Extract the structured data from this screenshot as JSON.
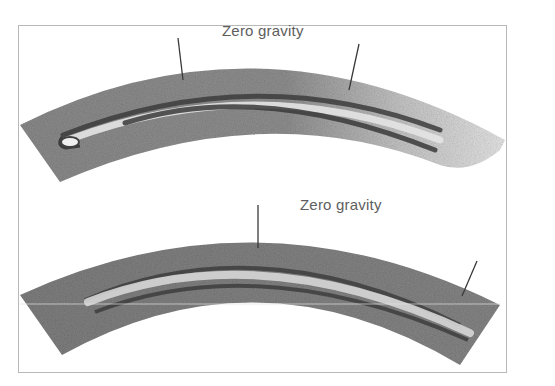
{
  "figure": {
    "panels": [
      {
        "id": "top",
        "label": "Zero gravity",
        "pointers": 2,
        "description": "Curved grayscale band with a looped tube structure, lighter/fading at right end"
      },
      {
        "id": "bottom",
        "label": "Zero gravity",
        "pointers": 2,
        "description": "Curved grayscale band with a straight tube structure along the arc"
      }
    ],
    "colors": {
      "background": "#ffffff",
      "frame": "#b8b8b8",
      "band_dark": "#5a5a5a",
      "band_mid": "#8c8c8c",
      "band_light": "#c8c8c8",
      "tube_light": "#e2e2e2",
      "label": "#5e5e5e"
    }
  }
}
